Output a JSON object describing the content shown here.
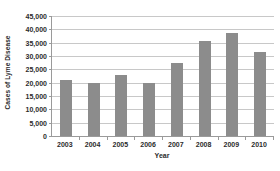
{
  "chart_data": {
    "type": "bar",
    "title": "",
    "xlabel": "Year",
    "ylabel": "Cases of Lyme Disease",
    "categories": [
      "2003",
      "2004",
      "2005",
      "2006",
      "2007",
      "2008",
      "2009",
      "2010"
    ],
    "values": [
      21000,
      20000,
      23000,
      20000,
      27500,
      35500,
      38500,
      31500
    ],
    "ylim": [
      0,
      45000
    ],
    "ytick_values": [
      0,
      5000,
      10000,
      15000,
      20000,
      25000,
      30000,
      35000,
      40000,
      45000
    ],
    "ytick_labels": [
      "0",
      "5,000",
      "10,000",
      "15,000",
      "20,000",
      "25,000",
      "30,000",
      "35,000",
      "40,000",
      "45,000"
    ],
    "grid": true,
    "grid_axis": "y",
    "legend": false,
    "bar_color": "#8c8c8c",
    "gridline_color": "#c8c8c8",
    "axis_color": "#9a9a9a",
    "text_color": "#2b2b2b",
    "background_color": "#ffffff"
  }
}
